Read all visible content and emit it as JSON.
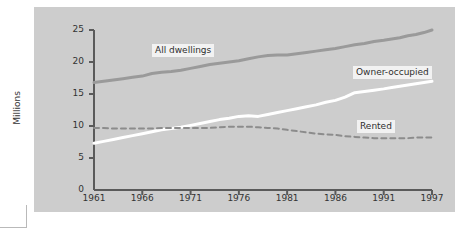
{
  "figure": {
    "panel_color": "#cdcdcd",
    "page_color": "#ffffff",
    "axis_color": "#5a5a5a"
  },
  "chart_data": {
    "type": "line",
    "title": "",
    "xlabel": "",
    "ylabel": "Millions",
    "xlim": [
      1961,
      1997
    ],
    "ylim": [
      0,
      25
    ],
    "xticks": [
      "1961",
      "1966",
      "1971",
      "1976",
      "1981",
      "1986",
      "1991",
      "1997"
    ],
    "yticks": [
      "0",
      "5",
      "10",
      "15",
      "20",
      "25"
    ],
    "grid": false,
    "legend_position": "inline-labels",
    "series": [
      {
        "name": "All dwellings",
        "style": "solid",
        "color": "#9a9a9a",
        "label": "All dwellings",
        "x": [
          1961,
          1962,
          1963,
          1964,
          1965,
          1966,
          1967,
          1968,
          1969,
          1970,
          1971,
          1972,
          1973,
          1974,
          1975,
          1976,
          1977,
          1978,
          1979,
          1980,
          1981,
          1982,
          1983,
          1984,
          1985,
          1986,
          1987,
          1988,
          1989,
          1990,
          1991,
          1992,
          1993,
          1994,
          1995,
          1996,
          1997
        ],
        "values": [
          16.8,
          17.0,
          17.2,
          17.4,
          17.6,
          17.8,
          18.2,
          18.4,
          18.5,
          18.7,
          19.0,
          19.3,
          19.6,
          19.8,
          20.0,
          20.2,
          20.5,
          20.8,
          21.0,
          21.1,
          21.1,
          21.3,
          21.5,
          21.7,
          21.9,
          22.1,
          22.4,
          22.7,
          22.9,
          23.2,
          23.4,
          23.6,
          23.8,
          24.1,
          24.3,
          24.6,
          25.0
        ]
      },
      {
        "name": "Owner-occupied",
        "style": "solid",
        "color": "#ffffff",
        "label": "Owner-occupied",
        "x": [
          1961,
          1962,
          1963,
          1964,
          1965,
          1966,
          1967,
          1968,
          1969,
          1970,
          1971,
          1972,
          1973,
          1974,
          1975,
          1976,
          1977,
          1978,
          1979,
          1980,
          1981,
          1982,
          1983,
          1984,
          1985,
          1986,
          1987,
          1988,
          1989,
          1990,
          1991,
          1992,
          1993,
          1994,
          1995,
          1996,
          1997
        ],
        "values": [
          7.3,
          7.6,
          7.9,
          8.2,
          8.5,
          8.8,
          9.1,
          9.4,
          9.6,
          9.8,
          10.1,
          10.4,
          10.7,
          11.0,
          11.2,
          11.5,
          11.6,
          11.5,
          11.8,
          12.1,
          12.4,
          12.7,
          13.0,
          13.3,
          13.7,
          14.0,
          14.5,
          15.2,
          15.4,
          15.6,
          15.8,
          16.0,
          16.2,
          16.4,
          16.6,
          16.8,
          17.0
        ]
      },
      {
        "name": "Rented",
        "style": "dashed",
        "color": "#8c8c8c",
        "label": "Rented",
        "x": [
          1961,
          1962,
          1963,
          1964,
          1965,
          1966,
          1967,
          1968,
          1969,
          1970,
          1971,
          1972,
          1973,
          1974,
          1975,
          1976,
          1977,
          1978,
          1979,
          1980,
          1981,
          1982,
          1983,
          1984,
          1985,
          1986,
          1987,
          1988,
          1989,
          1990,
          1991,
          1992,
          1993,
          1994,
          1995,
          1996,
          1997
        ],
        "values": [
          9.7,
          9.7,
          9.6,
          9.6,
          9.6,
          9.6,
          9.6,
          9.7,
          9.7,
          9.7,
          9.7,
          9.7,
          9.7,
          9.8,
          9.9,
          9.9,
          9.9,
          9.8,
          9.7,
          9.6,
          9.4,
          9.2,
          9.0,
          8.8,
          8.7,
          8.6,
          8.4,
          8.3,
          8.2,
          8.1,
          8.1,
          8.1,
          8.1,
          8.1,
          8.2,
          8.2,
          8.2
        ]
      }
    ]
  }
}
